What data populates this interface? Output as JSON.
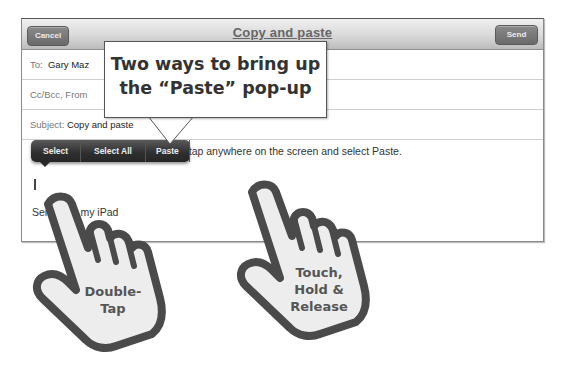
{
  "toolbar": {
    "cancel_label": "Cancel",
    "title": "Copy and paste",
    "send_label": "Send"
  },
  "fields": {
    "to_label": "To:",
    "to_value": "Gary Maz",
    "cc_label": "Cc/Bcc, From",
    "subject_label": "Subject:",
    "subject_value": "Copy and paste"
  },
  "body": {
    "text": "text, tap anywhere on the screen and select Paste.",
    "signature": "Sent from my iPad"
  },
  "edit_menu": {
    "items": [
      {
        "label": "Select"
      },
      {
        "label": "Select All"
      },
      {
        "label": "Paste"
      }
    ]
  },
  "callout": {
    "line1": "Two ways to bring up",
    "line2": "the “Paste” pop-up"
  },
  "hands": {
    "left": {
      "line1": "Double-",
      "line2": "Tap"
    },
    "right": {
      "line1": "Touch,",
      "line2": "Hold &",
      "line3": "Release"
    }
  },
  "colors": {
    "toolbar_button": "#757575",
    "popup_bg": "#2e2e2e",
    "hand_outline": "#4a4a4a",
    "hand_fill": "#ededed"
  }
}
